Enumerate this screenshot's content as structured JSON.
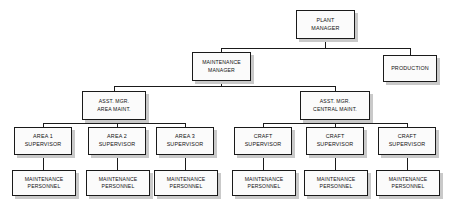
{
  "diagram": {
    "type": "org-chart",
    "style": {
      "box_fill": "#fbfbfb",
      "box_border": "#1a1a1a",
      "box_shadow": "#c9c9c9",
      "line_color": "#1a1a1a",
      "background": "#ffffff",
      "text_color": "#111111"
    },
    "nodes": [
      {
        "id": "plant-manager",
        "label": "PLANT\nMANAGER",
        "level": 1,
        "x": 296,
        "y": 10,
        "w": 59,
        "h": 29
      },
      {
        "id": "maintenance-manager",
        "label": "MAINTENANCE\nMANAGER",
        "level": 2,
        "x": 192,
        "y": 52,
        "w": 59,
        "h": 29
      },
      {
        "id": "production",
        "label": "PRODUCTION",
        "level": 2,
        "x": 383,
        "y": 55,
        "w": 54,
        "h": 27
      },
      {
        "id": "asst-mgr-area-maint",
        "label": "ASST. MGR.\nAREA MAINT.",
        "level": 3,
        "x": 82,
        "y": 91,
        "w": 64,
        "h": 29
      },
      {
        "id": "asst-mgr-central-maint",
        "label": "ASST. MGR.\nCENTRAL MAINT.",
        "level": 3,
        "x": 300,
        "y": 91,
        "w": 70,
        "h": 29
      },
      {
        "id": "area-1-supervisor",
        "label": "AREA 1\nSUPERVISOR",
        "level": 4,
        "x": 14,
        "y": 127,
        "w": 58,
        "h": 28
      },
      {
        "id": "area-2-supervisor",
        "label": "AREA 2\nSUPERVISOR",
        "level": 4,
        "x": 88,
        "y": 127,
        "w": 58,
        "h": 28
      },
      {
        "id": "area-3-supervisor",
        "label": "AREA 3\nSUPERVISOR",
        "level": 4,
        "x": 156,
        "y": 127,
        "w": 58,
        "h": 28
      },
      {
        "id": "craft-supervisor-1",
        "label": "CRAFT\nSUPERVISOR",
        "level": 4,
        "x": 234,
        "y": 127,
        "w": 58,
        "h": 28
      },
      {
        "id": "craft-supervisor-2",
        "label": "CRAFT\nSUPERVISOR",
        "level": 4,
        "x": 306,
        "y": 127,
        "w": 58,
        "h": 28
      },
      {
        "id": "craft-supervisor-3",
        "label": "CRAFT\nSUPERVISOR",
        "level": 4,
        "x": 378,
        "y": 127,
        "w": 58,
        "h": 28
      },
      {
        "id": "maintenance-personnel-1",
        "label": "MAINTENANCE\nPERSONNEL",
        "level": 5,
        "x": 12,
        "y": 170,
        "w": 64,
        "h": 26
      },
      {
        "id": "maintenance-personnel-2",
        "label": "MAINTENANCE\nPERSONNEL",
        "level": 5,
        "x": 86,
        "y": 170,
        "w": 64,
        "h": 26
      },
      {
        "id": "maintenance-personnel-3",
        "label": "MAINTENANCE\nPERSONNEL",
        "level": 5,
        "x": 154,
        "y": 170,
        "w": 64,
        "h": 26
      },
      {
        "id": "maintenance-personnel-4",
        "label": "MAINTENANCE\nPERSONNEL",
        "level": 5,
        "x": 232,
        "y": 170,
        "w": 64,
        "h": 26
      },
      {
        "id": "maintenance-personnel-5",
        "label": "MAINTENANCE\nPERSONNEL",
        "level": 5,
        "x": 304,
        "y": 170,
        "w": 64,
        "h": 26
      },
      {
        "id": "maintenance-personnel-6",
        "label": "MAINTENANCE\nPERSONNEL",
        "level": 5,
        "x": 376,
        "y": 170,
        "w": 64,
        "h": 26
      }
    ],
    "edges": [
      {
        "from": "plant-manager",
        "to": "maintenance-manager"
      },
      {
        "from": "plant-manager",
        "to": "production"
      },
      {
        "from": "maintenance-manager",
        "to": "asst-mgr-area-maint"
      },
      {
        "from": "maintenance-manager",
        "to": "asst-mgr-central-maint"
      },
      {
        "from": "asst-mgr-area-maint",
        "to": "area-1-supervisor"
      },
      {
        "from": "asst-mgr-area-maint",
        "to": "area-2-supervisor"
      },
      {
        "from": "asst-mgr-area-maint",
        "to": "area-3-supervisor"
      },
      {
        "from": "asst-mgr-central-maint",
        "to": "craft-supervisor-1"
      },
      {
        "from": "asst-mgr-central-maint",
        "to": "craft-supervisor-2"
      },
      {
        "from": "asst-mgr-central-maint",
        "to": "craft-supervisor-3"
      },
      {
        "from": "area-1-supervisor",
        "to": "maintenance-personnel-1"
      },
      {
        "from": "area-2-supervisor",
        "to": "maintenance-personnel-2"
      },
      {
        "from": "area-3-supervisor",
        "to": "maintenance-personnel-3"
      },
      {
        "from": "craft-supervisor-1",
        "to": "maintenance-personnel-4"
      },
      {
        "from": "craft-supervisor-2",
        "to": "maintenance-personnel-5"
      },
      {
        "from": "craft-supervisor-3",
        "to": "maintenance-personnel-6"
      }
    ]
  }
}
